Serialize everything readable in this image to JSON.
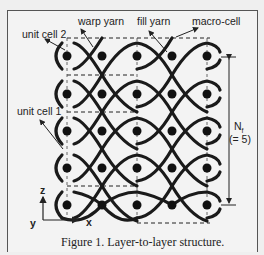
{
  "figure": {
    "caption": "Figure 1.  Layer-to-layer structure.",
    "labels": {
      "unit_cell_2": "unit cell 2",
      "warp_yarn": "warp yarn",
      "fill_yarn": "fill yarn",
      "macro_cell": "macro-cell",
      "unit_cell_1": "unit cell 1",
      "nf": "N",
      "nf_sub": "f",
      "nf_value": "(= 5)"
    },
    "axes": {
      "z": "z",
      "y": "y",
      "x": "x"
    },
    "grid": {
      "columns": 5,
      "rows": 5,
      "col_x": [
        67,
        102,
        137,
        172,
        207
      ],
      "row_y": [
        56,
        94,
        131,
        168,
        205
      ]
    },
    "colors": {
      "yarn": "#1a1a1a",
      "frame": "#555555",
      "background": "#f3f3f3"
    }
  }
}
